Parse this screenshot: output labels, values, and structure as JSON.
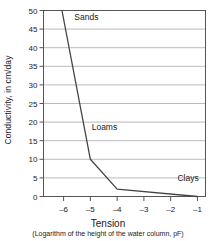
{
  "chart_data": {
    "type": "line",
    "title": "",
    "xlabel": "Tension",
    "xsublabel": "(Logarithm of the height of the water column, pF)",
    "ylabel": "Conductivity, in cm/day",
    "xlim": [
      -6.75,
      -0.7
    ],
    "ylim": [
      0,
      50
    ],
    "grid": true,
    "legend_position": "inline-annotations",
    "xticks": [
      -6,
      -5,
      -4,
      -3,
      -2,
      -1
    ],
    "xtick_labels": [
      "–6",
      "–5",
      "–4",
      "–3",
      "–2",
      "–1"
    ],
    "yticks": [
      0,
      5,
      10,
      15,
      20,
      25,
      30,
      35,
      40,
      45,
      50
    ],
    "ytick_labels": [
      "0",
      "5",
      "10",
      "15",
      "20",
      "25",
      "30",
      "35",
      "40",
      "45",
      "50"
    ],
    "line_color": "#444444",
    "grid_color": "#aaaaaa",
    "axis_color": "#555555",
    "series": [
      {
        "name": "Conductivity curve",
        "x": [
          -6.06,
          -5.0,
          -4.0,
          -1.0
        ],
        "y": [
          50,
          10,
          2,
          0
        ]
      }
    ],
    "annotations": [
      {
        "text": "Sands",
        "x": -5.6,
        "y": 47.5
      },
      {
        "text": "Loams",
        "x": -4.95,
        "y": 18.0
      },
      {
        "text": "Clays",
        "x": -1.75,
        "y": 4.2
      }
    ]
  }
}
